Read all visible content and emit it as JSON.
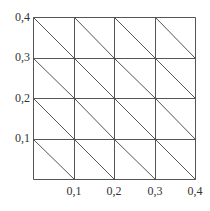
{
  "diagram": {
    "type": "triangulated-grid",
    "x_ticks": [
      "0,1",
      "0,2",
      "0,3",
      "0,4"
    ],
    "y_ticks": [
      "0,1",
      "0,2",
      "0,3",
      "0,4"
    ],
    "divisions": 4,
    "diagonal": "top-left to bottom-right in each cell",
    "line_color": "#555555"
  }
}
